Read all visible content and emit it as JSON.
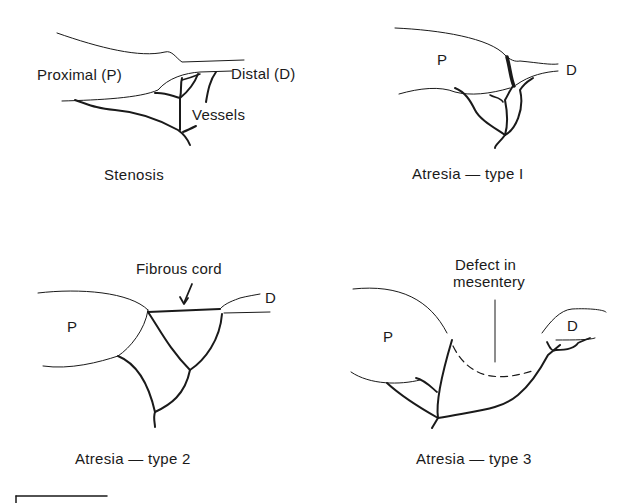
{
  "diagram": {
    "panels": [
      {
        "id": "stenosis",
        "caption": "Stenosis",
        "labels": {
          "proximal": "Proximal (P)",
          "distal": "Distal (D)",
          "vessels": "Vessels"
        }
      },
      {
        "id": "atresia-type-1",
        "caption": "Atresia — type I",
        "labels": {
          "proximal": "P",
          "distal": "D"
        }
      },
      {
        "id": "atresia-type-2",
        "caption": "Atresia — type 2",
        "labels": {
          "proximal": "P",
          "distal": "D",
          "annotation": "Fibrous cord"
        }
      },
      {
        "id": "atresia-type-3",
        "caption": "Atresia — type 3",
        "labels": {
          "proximal": "P",
          "distal": "D",
          "annotation_line1": "Defect in",
          "annotation_line2": "mesentery"
        }
      }
    ],
    "colors": {
      "line": "#1a1a1a",
      "background": "#ffffff"
    }
  }
}
